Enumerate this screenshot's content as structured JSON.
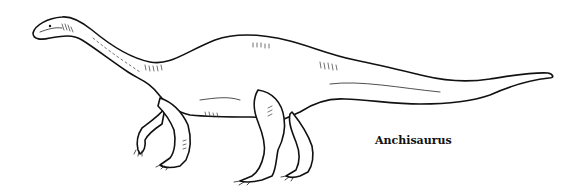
{
  "illustration": {
    "subject": "dinosaur line drawing",
    "style": "black ink on white",
    "caption": "Anchisaurus"
  },
  "colors": {
    "background": "#ffffff",
    "ink": "#111111"
  }
}
